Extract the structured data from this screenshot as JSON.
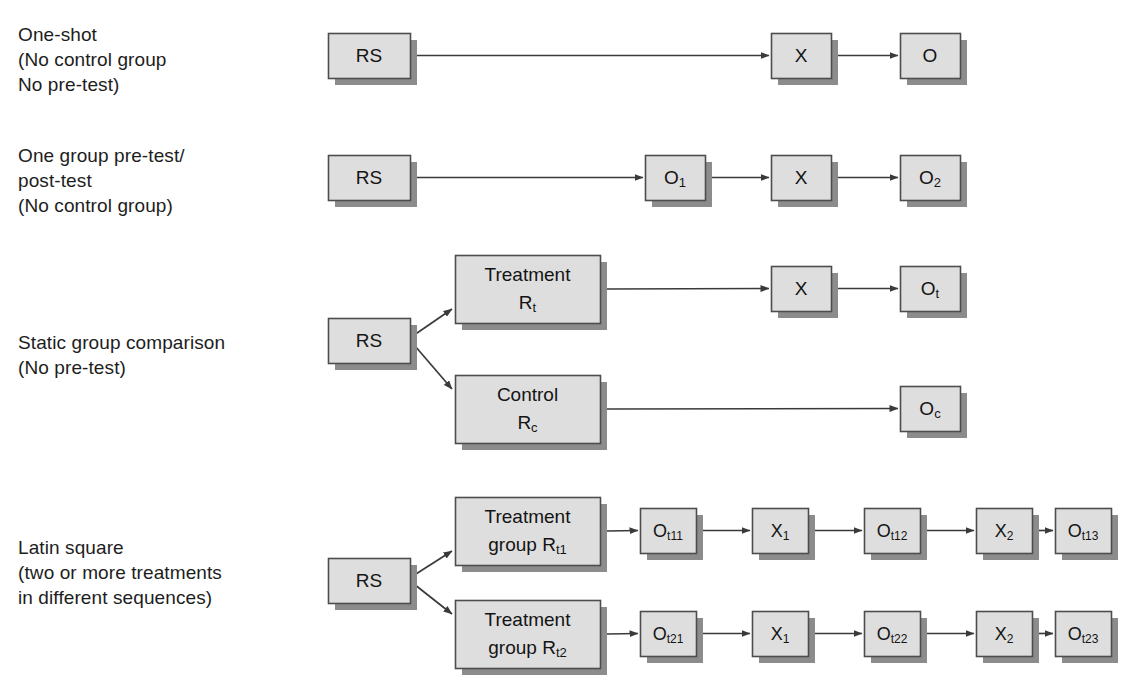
{
  "figure": {
    "style": {
      "box_fill": "#dedede",
      "box_stroke": "#4d4d4d",
      "box_shadow": "#8c8c8c",
      "arrow_color": "#3a3a3a",
      "text_color": "#141414",
      "background": "#ffffff"
    }
  },
  "rows": [
    {
      "id": "one-shot",
      "label_lines": [
        "One-shot",
        "(No control group",
        "No pre-test)"
      ],
      "label_x": 18,
      "label_y": 22,
      "nodes": [
        {
          "id": "rs-1",
          "text": "RS",
          "sub": "",
          "x": 328,
          "y": 33,
          "w": 82,
          "h": 45,
          "font": 19
        },
        {
          "id": "x-1",
          "text": "X",
          "sub": "",
          "x": 771,
          "y": 33,
          "w": 60,
          "h": 45,
          "font": 19
        },
        {
          "id": "o-1",
          "text": "O",
          "sub": "",
          "x": 900,
          "y": 33,
          "w": 60,
          "h": 45,
          "font": 19
        }
      ],
      "arrows": [
        {
          "from": "rs-1",
          "to": "x-1",
          "kind": "straight"
        },
        {
          "from": "x-1",
          "to": "o-1",
          "kind": "straight"
        }
      ]
    },
    {
      "id": "one-group-pre-post",
      "label_lines": [
        "One group pre-test/",
        "post-test",
        "(No control group)"
      ],
      "label_x": 18,
      "label_y": 143,
      "nodes": [
        {
          "id": "rs-2",
          "text": "RS",
          "sub": "",
          "x": 328,
          "y": 155,
          "w": 82,
          "h": 45,
          "font": 19
        },
        {
          "id": "o1-2",
          "text": "O",
          "sub": "1",
          "x": 645,
          "y": 155,
          "w": 60,
          "h": 45,
          "font": 19
        },
        {
          "id": "x-2",
          "text": "X",
          "sub": "",
          "x": 771,
          "y": 155,
          "w": 60,
          "h": 45,
          "font": 19
        },
        {
          "id": "o2-2",
          "text": "O",
          "sub": "2",
          "x": 900,
          "y": 155,
          "w": 60,
          "h": 45,
          "font": 19
        }
      ],
      "arrows": [
        {
          "from": "rs-2",
          "to": "o1-2",
          "kind": "straight"
        },
        {
          "from": "o1-2",
          "to": "x-2",
          "kind": "straight"
        },
        {
          "from": "x-2",
          "to": "o2-2",
          "kind": "straight"
        }
      ]
    },
    {
      "id": "static-group-comparison",
      "label_lines": [
        "Static group comparison",
        "(No pre-test)"
      ],
      "label_x": 18,
      "label_y": 330,
      "nodes": [
        {
          "id": "rs-3",
          "text": "RS",
          "sub": "",
          "x": 328,
          "y": 318,
          "w": 82,
          "h": 45,
          "font": 19
        },
        {
          "id": "treat-3",
          "text": "Treatment",
          "sub": "",
          "line2": "R",
          "line2sub": "t",
          "x": 455,
          "y": 255,
          "w": 145,
          "h": 68,
          "font": 19
        },
        {
          "id": "ctrl-3",
          "text": "Control",
          "sub": "",
          "line2": "R",
          "line2sub": "c",
          "x": 455,
          "y": 375,
          "w": 145,
          "h": 68,
          "font": 19
        },
        {
          "id": "x-3",
          "text": "X",
          "sub": "",
          "x": 771,
          "y": 266,
          "w": 60,
          "h": 45,
          "font": 19
        },
        {
          "id": "ot-3",
          "text": "O",
          "sub": "t",
          "x": 900,
          "y": 266,
          "w": 60,
          "h": 45,
          "font": 19
        },
        {
          "id": "oc-3",
          "text": "O",
          "sub": "c",
          "x": 900,
          "y": 386,
          "w": 60,
          "h": 45,
          "font": 19
        }
      ],
      "arrows": [
        {
          "from": "rs-3",
          "to": "treat-3",
          "kind": "diagonal-up"
        },
        {
          "from": "rs-3",
          "to": "ctrl-3",
          "kind": "diagonal-down"
        },
        {
          "from": "treat-3",
          "to": "x-3",
          "kind": "straight"
        },
        {
          "from": "x-3",
          "to": "ot-3",
          "kind": "straight"
        },
        {
          "from": "ctrl-3",
          "to": "oc-3",
          "kind": "straight"
        }
      ]
    },
    {
      "id": "latin-square",
      "label_lines": [
        "Latin square",
        "(two or more treatments",
        "in different sequences)"
      ],
      "label_x": 18,
      "label_y": 535,
      "nodes": [
        {
          "id": "rs-4",
          "text": "RS",
          "sub": "",
          "x": 328,
          "y": 558,
          "w": 82,
          "h": 45,
          "font": 19
        },
        {
          "id": "tg1-4",
          "text": "Treatment",
          "sub": "",
          "line2": "group R",
          "line2sub": "t1",
          "x": 455,
          "y": 497,
          "w": 145,
          "h": 68,
          "font": 19
        },
        {
          "id": "tg2-4",
          "text": "Treatment",
          "sub": "",
          "line2": "group R",
          "line2sub": "t2",
          "x": 455,
          "y": 600,
          "w": 145,
          "h": 68,
          "font": 19
        },
        {
          "id": "ot11",
          "text": "O",
          "sub": "t11",
          "x": 640,
          "y": 508,
          "w": 56,
          "h": 45,
          "font": 18
        },
        {
          "id": "x1-a",
          "text": "X",
          "sub": "1",
          "x": 752,
          "y": 508,
          "w": 56,
          "h": 45,
          "font": 18
        },
        {
          "id": "ot12",
          "text": "O",
          "sub": "t12",
          "x": 864,
          "y": 508,
          "w": 56,
          "h": 45,
          "font": 18
        },
        {
          "id": "x2-a",
          "text": "X",
          "sub": "2",
          "x": 976,
          "y": 508,
          "w": 56,
          "h": 45,
          "font": 18
        },
        {
          "id": "ot13",
          "text": "O",
          "sub": "t13",
          "x": 1055,
          "y": 508,
          "w": 56,
          "h": 45,
          "font": 18
        },
        {
          "id": "ot21",
          "text": "O",
          "sub": "t21",
          "x": 640,
          "y": 611,
          "w": 56,
          "h": 45,
          "font": 18
        },
        {
          "id": "x1-b",
          "text": "X",
          "sub": "1",
          "x": 752,
          "y": 611,
          "w": 56,
          "h": 45,
          "font": 18
        },
        {
          "id": "ot22",
          "text": "O",
          "sub": "t22",
          "x": 864,
          "y": 611,
          "w": 56,
          "h": 45,
          "font": 18
        },
        {
          "id": "x2-b",
          "text": "X",
          "sub": "2",
          "x": 976,
          "y": 611,
          "w": 56,
          "h": 45,
          "font": 18
        },
        {
          "id": "ot23",
          "text": "O",
          "sub": "t23",
          "x": 1055,
          "y": 611,
          "w": 56,
          "h": 45,
          "font": 18
        }
      ],
      "arrows": [
        {
          "from": "rs-4",
          "to": "tg1-4",
          "kind": "diagonal-up"
        },
        {
          "from": "rs-4",
          "to": "tg2-4",
          "kind": "diagonal-down"
        },
        {
          "from": "tg1-4",
          "to": "ot11",
          "kind": "straight"
        },
        {
          "from": "ot11",
          "to": "x1-a",
          "kind": "straight"
        },
        {
          "from": "x1-a",
          "to": "ot12",
          "kind": "straight"
        },
        {
          "from": "ot12",
          "to": "x2-a",
          "kind": "straight"
        },
        {
          "from": "x2-a",
          "to": "ot13",
          "kind": "straight"
        },
        {
          "from": "tg2-4",
          "to": "ot21",
          "kind": "straight"
        },
        {
          "from": "ot21",
          "to": "x1-b",
          "kind": "straight"
        },
        {
          "from": "x1-b",
          "to": "ot22",
          "kind": "straight"
        },
        {
          "from": "ot22",
          "to": "x2-b",
          "kind": "straight"
        },
        {
          "from": "x2-b",
          "to": "ot23",
          "kind": "straight"
        }
      ]
    }
  ]
}
